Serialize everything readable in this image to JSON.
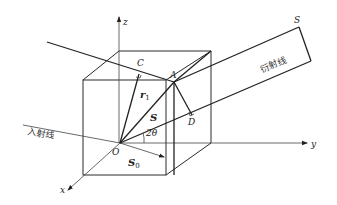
{
  "diagram": {
    "axes": {
      "x": "x",
      "y": "y",
      "z": "z"
    },
    "points": {
      "origin": "O",
      "A": "A",
      "C": "C",
      "D": "D",
      "S": "S"
    },
    "vectors": {
      "r1": "r",
      "r1_sub": "1",
      "S": "S",
      "S0": "S",
      "S0_sub": "0"
    },
    "angle": "2θ",
    "labels": {
      "incident": "入射线",
      "diffracted": "衍射线"
    }
  }
}
